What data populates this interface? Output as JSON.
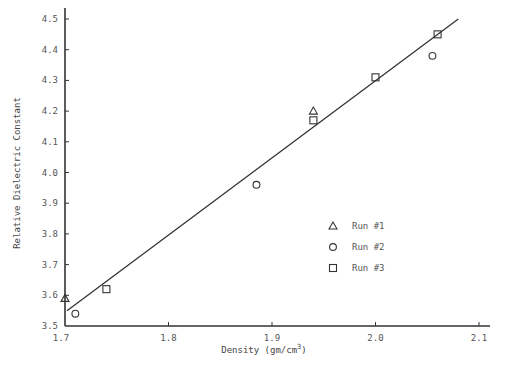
{
  "chart_data": {
    "type": "scatter",
    "title": "",
    "xlabel": "Density (gm/cm",
    "xlabel_superscript": "3",
    "xlabel_suffix": ")",
    "ylabel": "Relative Dielectric Constant",
    "xlim": [
      1.7,
      2.12
    ],
    "ylim": [
      3.5,
      4.5
    ],
    "xticks": [
      1.7,
      1.8,
      1.9,
      2.0,
      2.1
    ],
    "xtick_labels": [
      "1.7",
      "1.8",
      "1.9",
      "2.0",
      "2.1"
    ],
    "yticks": [
      3.5,
      3.6,
      3.7,
      3.8,
      3.9,
      4.0,
      4.1,
      4.2,
      4.3,
      4.4,
      4.5
    ],
    "ytick_labels": [
      "3.5",
      "3.6",
      "3.7",
      "3.8",
      "3.9",
      "4.0",
      "4.1",
      "4.2",
      "4.3",
      "4.4",
      "4.5"
    ],
    "grid": false,
    "legend_position": "inside-right",
    "series": [
      {
        "name": "Run #1",
        "marker": "triangle",
        "points": [
          [
            1.7,
            3.59
          ],
          [
            1.94,
            4.2
          ]
        ]
      },
      {
        "name": "Run #2",
        "marker": "circle",
        "points": [
          [
            1.71,
            3.54
          ],
          [
            1.885,
            3.96
          ],
          [
            2.055,
            4.38
          ]
        ]
      },
      {
        "name": "Run #3",
        "marker": "square",
        "points": [
          [
            1.74,
            3.62
          ],
          [
            1.94,
            4.17
          ],
          [
            2.0,
            4.31
          ],
          [
            2.06,
            4.45
          ]
        ]
      }
    ],
    "fit_line": {
      "from": [
        1.7,
        3.55
      ],
      "to": [
        2.08,
        4.5
      ]
    }
  },
  "legend": {
    "items": [
      {
        "label": "Run #1",
        "marker": "triangle"
      },
      {
        "label": "Run #2",
        "marker": "circle"
      },
      {
        "label": "Run #3",
        "marker": "square"
      }
    ]
  },
  "colors": {
    "ink": "#333333",
    "text": "#555555",
    "background": "#ffffff"
  }
}
